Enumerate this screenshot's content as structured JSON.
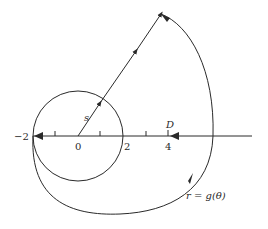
{
  "diagram": {
    "type": "contour-mapping",
    "axis_labels": {
      "minus_two": "−2",
      "zero": "0",
      "two": "2",
      "four": "4"
    },
    "point_labels": {
      "D": "D",
      "s": "s"
    },
    "curve_label": "r = g(θ)",
    "colors": {
      "stroke": "#2a2a2a",
      "background": "#ffffff"
    }
  }
}
